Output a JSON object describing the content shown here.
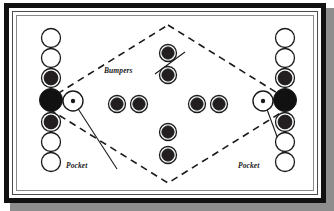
{
  "figure": {
    "background_color": "#ffffff",
    "frame_color": "#111111",
    "shadow_color": "#8d8d8d",
    "ink_color": "#1a1a1a"
  },
  "labels": {
    "bumpers": "Bumpers",
    "pocket_left": "Pocket",
    "pocket_right": "Pocket"
  },
  "chart_data": {
    "type": "scatter",
    "xlabel": "",
    "ylabel": "",
    "xlim": [
      0,
      296
    ],
    "ylim": [
      0,
      174
    ],
    "grid": false,
    "legend": "none",
    "annotations": [
      {
        "text": "Bumpers",
        "x": 104,
        "y": 55,
        "leader_to": {
          "x": 168,
          "y": 36
        },
        "style": "italic-bold"
      },
      {
        "text": "Pocket",
        "x": 66,
        "y": 150,
        "leader_to": {
          "x": 58,
          "y": 88
        },
        "style": "italic-bold"
      },
      {
        "text": "Pocket",
        "x": 238,
        "y": 150,
        "leader_to": {
          "x": 248,
          "y": 88
        },
        "style": "italic-bold"
      }
    ],
    "diamond": {
      "name": "dashed-diamond-guide",
      "points": [
        {
          "x": 151,
          "y": 9
        },
        {
          "x": 278,
          "y": 88
        },
        {
          "x": 151,
          "y": 167
        },
        {
          "x": 24,
          "y": 88
        }
      ],
      "stroke": "#1a1a1a",
      "dash": "7 5",
      "width": 1.6
    },
    "series": [
      {
        "name": "left-wall-targets",
        "kind": "ring-stack",
        "items": [
          {
            "x": 34,
            "y": 22,
            "r": 9.5,
            "fill": "#ffffff",
            "style": "open"
          },
          {
            "x": 34,
            "y": 42,
            "r": 9.5,
            "fill": "#ffffff",
            "style": "open"
          },
          {
            "x": 34,
            "y": 62,
            "r": 9.5,
            "fill": "#231f20",
            "style": "ringed"
          },
          {
            "x": 34,
            "y": 84,
            "r": 11.5,
            "fill": "#111111",
            "style": "solid"
          },
          {
            "x": 34,
            "y": 106,
            "r": 9.5,
            "fill": "#231f20",
            "style": "ringed"
          },
          {
            "x": 34,
            "y": 126,
            "r": 9.5,
            "fill": "#ffffff",
            "style": "open"
          },
          {
            "x": 34,
            "y": 146,
            "r": 9.5,
            "fill": "#ffffff",
            "style": "open"
          }
        ]
      },
      {
        "name": "right-wall-targets",
        "kind": "ring-stack",
        "items": [
          {
            "x": 268,
            "y": 22,
            "r": 9.5,
            "fill": "#ffffff",
            "style": "open"
          },
          {
            "x": 268,
            "y": 42,
            "r": 9.5,
            "fill": "#ffffff",
            "style": "open"
          },
          {
            "x": 268,
            "y": 62,
            "r": 9.5,
            "fill": "#231f20",
            "style": "ringed"
          },
          {
            "x": 268,
            "y": 84,
            "r": 11.5,
            "fill": "#111111",
            "style": "solid"
          },
          {
            "x": 268,
            "y": 106,
            "r": 9.5,
            "fill": "#231f20",
            "style": "ringed"
          },
          {
            "x": 268,
            "y": 126,
            "r": 9.5,
            "fill": "#ffffff",
            "style": "open"
          },
          {
            "x": 268,
            "y": 146,
            "r": 9.5,
            "fill": "#ffffff",
            "style": "open"
          }
        ]
      },
      {
        "name": "center-bumpers",
        "kind": "bumper",
        "items": [
          {
            "x": 151,
            "y": 37,
            "r": 8.5
          },
          {
            "x": 151,
            "y": 59,
            "r": 8.5
          },
          {
            "x": 100,
            "y": 88,
            "r": 8.5
          },
          {
            "x": 122,
            "y": 88,
            "r": 8.5
          },
          {
            "x": 180,
            "y": 88,
            "r": 8.5
          },
          {
            "x": 202,
            "y": 88,
            "r": 8.5
          },
          {
            "x": 151,
            "y": 116,
            "r": 8.5
          },
          {
            "x": 151,
            "y": 139,
            "r": 8.5
          }
        ]
      },
      {
        "name": "pockets",
        "kind": "pocket",
        "items": [
          {
            "x": 56,
            "y": 85,
            "r": 10,
            "dot_r": 2.2
          },
          {
            "x": 246,
            "y": 85,
            "r": 10,
            "dot_r": 2.2
          }
        ]
      }
    ]
  }
}
